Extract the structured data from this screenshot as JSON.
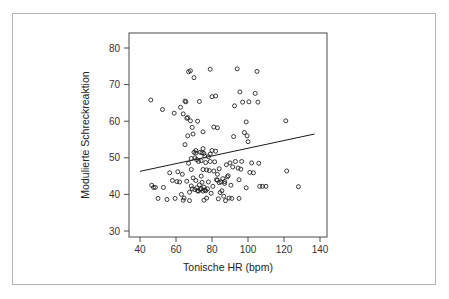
{
  "figure": {
    "background_color": "#ffffff",
    "frame_color": "#b4b4b4",
    "axis_color": "#4a4a4a",
    "point_color": "#1a1a1a",
    "line_color": "#1a1a1a"
  },
  "chart_data": {
    "type": "scatter",
    "title": "",
    "xlabel": "Tonische HR (bpm)",
    "ylabel": "Modulierte Schreckreaktion",
    "xlim": [
      36,
      144
    ],
    "ylim": [
      27.5,
      83
    ],
    "xticks": [
      40,
      60,
      80,
      100,
      120,
      140
    ],
    "yticks": [
      30,
      40,
      50,
      60,
      70,
      80
    ],
    "xtick_labels": [
      "40",
      "60",
      "80",
      "100",
      "120",
      "140"
    ],
    "ytick_labels": [
      "30",
      "40",
      "50",
      "60",
      "70",
      "80"
    ],
    "grid": false,
    "legend": null,
    "marker": "open-circle",
    "marker_size": 3.0,
    "trendline": {
      "type": "linear-regression",
      "x_start": 40.0,
      "y_start": 46.3,
      "x_end": 137.0,
      "y_end": 56.5,
      "slope": 0.105,
      "intercept": 42.1
    },
    "x": [
      46.0,
      46.5,
      47.5,
      48.5,
      50.0,
      52.5,
      53.0,
      55.0,
      56.5,
      58.0,
      59.0,
      59.5,
      60.5,
      61.0,
      62.0,
      62.5,
      63.0,
      63.5,
      64.0,
      64.5,
      65.0,
      65.0,
      65.5,
      66.0,
      66.0,
      66.5,
      67.0,
      67.0,
      67.5,
      67.5,
      68.0,
      68.0,
      68.5,
      68.5,
      68.5,
      69.0,
      69.0,
      69.5,
      69.5,
      70.0,
      70.0,
      70.5,
      70.5,
      71.0,
      71.0,
      71.5,
      71.5,
      72.0,
      72.0,
      72.5,
      72.5,
      73.0,
      73.0,
      73.5,
      73.5,
      74.0,
      74.0,
      74.0,
      74.5,
      74.5,
      75.0,
      75.0,
      75.0,
      75.5,
      75.5,
      75.5,
      76.0,
      76.0,
      76.5,
      76.5,
      77.0,
      77.0,
      77.5,
      78.0,
      78.0,
      78.5,
      79.0,
      79.0,
      79.5,
      80.0,
      80.0,
      80.5,
      81.0,
      81.0,
      81.5,
      82.0,
      82.0,
      82.5,
      83.0,
      83.0,
      83.5,
      84.0,
      84.0,
      84.5,
      85.0,
      85.5,
      86.0,
      86.5,
      87.0,
      87.5,
      88.0,
      88.5,
      89.0,
      89.5,
      90.0,
      90.5,
      91.0,
      92.0,
      92.5,
      93.0,
      94.0,
      94.5,
      95.0,
      95.5,
      96.0,
      96.5,
      97.0,
      98.0,
      99.0,
      99.5,
      100.0,
      100.5,
      101.0,
      102.0,
      103.0,
      104.0,
      105.0,
      105.5,
      106.0,
      106.5,
      108.0,
      110.0,
      121.0,
      121.5,
      128.0,
      64.0,
      66.5,
      71.0,
      75.0,
      79.0,
      83.0,
      87.0,
      91.5,
      95.0,
      99.0
    ],
    "y": [
      65.8,
      42.5,
      41.9,
      41.9,
      38.9,
      63.2,
      41.9,
      38.6,
      45.9,
      43.8,
      62.2,
      38.9,
      43.5,
      46.2,
      43.4,
      63.8,
      40.0,
      45.5,
      38.4,
      39.0,
      65.5,
      53.6,
      65.3,
      60.8,
      43.6,
      61.0,
      73.5,
      48.5,
      40.6,
      38.3,
      73.8,
      60.1,
      49.8,
      46.8,
      42.3,
      58.3,
      41.5,
      56.5,
      44.5,
      71.9,
      51.5,
      50.0,
      41.3,
      51.3,
      43.8,
      49.5,
      41.8,
      60.0,
      41.0,
      49.0,
      40.9,
      65.4,
      42.6,
      51.5,
      41.3,
      49.2,
      45.0,
      41.6,
      51.4,
      43.3,
      57.1,
      46.8,
      40.9,
      51.2,
      42.0,
      38.4,
      50.5,
      41.2,
      48.7,
      41.0,
      46.7,
      39.0,
      41.5,
      50.3,
      43.4,
      46.5,
      74.2,
      51.0,
      40.3,
      66.7,
      52.0,
      42.2,
      58.4,
      46.4,
      48.9,
      66.9,
      51.8,
      44.0,
      58.2,
      43.9,
      38.8,
      47.0,
      43.2,
      40.5,
      43.4,
      41.0,
      44.3,
      39.5,
      43.5,
      38.3,
      48.1,
      44.8,
      45.1,
      39.0,
      48.6,
      42.5,
      38.9,
      55.8,
      64.2,
      49.0,
      74.3,
      47.2,
      38.9,
      68.0,
      46.9,
      49.0,
      65.2,
      56.9,
      59.8,
      56.0,
      54.4,
      65.3,
      46.0,
      48.6,
      45.9,
      67.6,
      73.6,
      65.2,
      48.5,
      42.2,
      42.2,
      42.2,
      60.1,
      46.4,
      42.1,
      62.0,
      56.0,
      52.0,
      52.5,
      49.0,
      45.5,
      43.0,
      47.5,
      44.0,
      41.8
    ]
  }
}
